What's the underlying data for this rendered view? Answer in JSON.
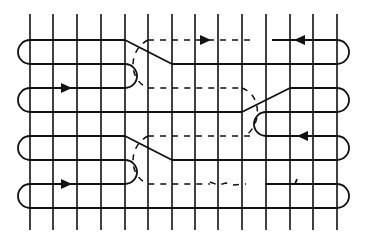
{
  "diagram": {
    "title": "",
    "colors": {
      "stroke": "#111111",
      "background": "#ffffff"
    },
    "grid": {
      "vertical_x": [
        30,
        53,
        77,
        101,
        125,
        148,
        172,
        195,
        218,
        242,
        266,
        290,
        313,
        337
      ],
      "vertical_top": 14,
      "vertical_bottom": 230,
      "row_y": [
        40,
        64,
        88,
        112,
        136,
        160,
        184,
        208
      ]
    },
    "solid_paths": [
      {
        "name": "upper-left-block",
        "d": "M125 40 L30 40 A12 12 0 0 0 30 64"
      },
      {
        "name": "diag-1",
        "d": "M125 40 L172 64 L337 64"
      },
      {
        "name": "row-64-left",
        "d": "M30 64 L125 64 A12 12 0 0 1 125 88 L30 88 A12 12 0 0 0 30 112"
      },
      {
        "name": "row-112-left",
        "d": "M30 112 L242 112 L290 88 L337 88 A12 12 0 0 1 337 112 L266 112"
      },
      {
        "name": "right-top-loop",
        "d": "M272 40 L337 40 A12 12 0 0 1 337 64"
      },
      {
        "name": "row-136",
        "d": "M125 136 L30 136 A12 12 0 0 0 30 160 L125 160 A12 12 0 0 1 125 184 L30 184 A12 12 0 0 0 30 208 L337 208"
      },
      {
        "name": "diag-2",
        "d": "M125 136 L172 160 L337 160"
      },
      {
        "name": "right-mid-loop",
        "d": "M266 112 A12 12 0 0 0 266 136 L337 136 A12 12 0 0 1 337 160"
      },
      {
        "name": "right-bottom-loop",
        "d": "M294 184 L337 184 A12 12 0 0 1 337 208"
      },
      {
        "name": "short-stroke",
        "d": "M265 184 L295 184 L297 179"
      }
    ],
    "dashed_paths": [
      {
        "name": "top-dashed",
        "d": "M148 40 L250 40"
      },
      {
        "name": "dashed-arc-1",
        "d": "M148 40 C128 50 128 80 148 88 L242 88"
      },
      {
        "name": "dashed-arc-2",
        "d": "M242 88 C262 95 262 125 245 136"
      },
      {
        "name": "dashed-mid",
        "d": "M148 136 L250 136"
      },
      {
        "name": "dashed-arc-3",
        "d": "M148 136 C128 146 128 176 148 184 L210 184"
      },
      {
        "name": "dashed-scribble",
        "d": "M210 182 L218 185 L226 183 L234 185 L246 184"
      }
    ],
    "arrows": [
      {
        "name": "arrow-top-dashed-right",
        "x": 205,
        "y": 40,
        "dir": "right"
      },
      {
        "name": "arrow-top-right-left",
        "x": 300,
        "y": 40,
        "dir": "left"
      },
      {
        "name": "arrow-row-88-right",
        "x": 66,
        "y": 88,
        "dir": "right"
      },
      {
        "name": "arrow-row-136-left",
        "x": 303,
        "y": 136,
        "dir": "left"
      },
      {
        "name": "arrow-row-184-right",
        "x": 66,
        "y": 184,
        "dir": "right"
      }
    ]
  }
}
